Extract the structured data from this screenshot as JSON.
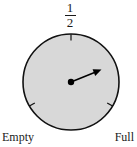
{
  "figure": {
    "name": "fuel-gauge-diagram",
    "type": "gauge",
    "top_label": {
      "numerator": "1",
      "denominator": "2"
    },
    "left_label": "Empty",
    "right_label": "Full",
    "colors": {
      "dial_fill": "#d8d8d8",
      "dial_stroke": "#111111",
      "needle": "#000000",
      "text": "#1a1a1a",
      "background": "#ffffff"
    },
    "geometry": {
      "center_x": 71,
      "center_y": 82,
      "radius": 48,
      "needle_tip_x": 101,
      "needle_tip_y": 70,
      "needle_angle_degrees": 22,
      "tick_top_degrees": 90,
      "tick_left_degrees": 210,
      "tick_right_degrees": 330
    }
  }
}
